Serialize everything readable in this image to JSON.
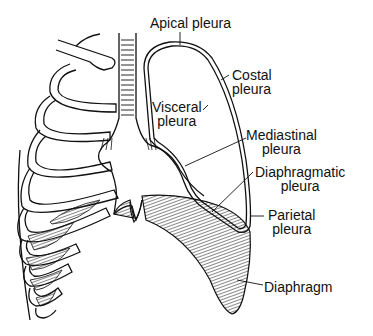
{
  "figure": {
    "colors": {
      "ink": "#111111",
      "background": "#ffffff"
    }
  },
  "labels": {
    "apical": {
      "line1": "Apical pleura"
    },
    "costal": {
      "line1": "Costal",
      "line2": "pleura"
    },
    "visceral": {
      "line1": "Visceral",
      "line2": "pleura"
    },
    "mediastinal": {
      "line1": "Mediastinal",
      "line2": "pleura"
    },
    "diaphragmatic": {
      "line1": "Diaphragmatic",
      "line2": "pleura"
    },
    "parietal": {
      "line1": "Parietal",
      "line2": "pleura"
    },
    "diaphragm": {
      "line1": "Diaphragm"
    }
  }
}
